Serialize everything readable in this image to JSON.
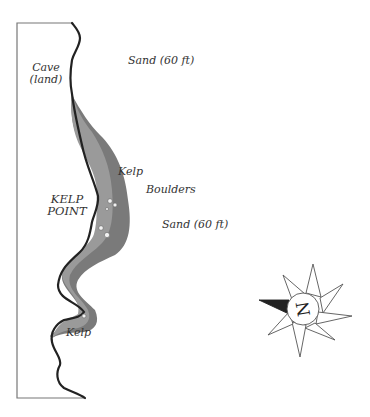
{
  "map": {
    "colors": {
      "background": "#ffffff",
      "land_outline": "#777777",
      "coastline": "#222222",
      "shallow_kelp": "#9a9a9a",
      "deep_kelp": "#7a7a7a",
      "boulder": "#f2f2f2",
      "compass_outline": "#555555",
      "compass_north_pointer": "#222222"
    },
    "labels": {
      "cave": "Cave",
      "cave_sub": "(land)",
      "sand_top": "Sand (60 ft)",
      "kelp_upper": "Kelp",
      "boulders": "Boulders",
      "point_line1": "KELP",
      "point_line2": "POINT",
      "sand_mid": "Sand (60 ft)",
      "kelp_lower": "Kelp"
    },
    "compass": {
      "letter": "N",
      "icon": "compass-rose-icon"
    }
  }
}
